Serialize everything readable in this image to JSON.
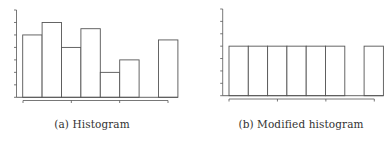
{
  "figure": {
    "captions": [
      {
        "label": "(a) Histogram"
      },
      {
        "label": "(b) Modified histogram"
      }
    ]
  },
  "chart_data": [
    {
      "type": "bar",
      "title": "(a) Histogram",
      "xlabel": "",
      "ylabel": "",
      "categories": [
        "1",
        "2",
        "3",
        "4",
        "5",
        "6",
        "7",
        "8"
      ],
      "values": [
        5,
        6,
        4,
        5.5,
        2,
        3,
        0,
        4.6
      ],
      "ylim": [
        0,
        7
      ],
      "y_ticks": 8,
      "x_ticks": 4,
      "grid": false,
      "legend": null,
      "bar_style": {
        "fill": "#ffffff",
        "stroke": "#555555"
      }
    },
    {
      "type": "bar",
      "title": "(b) Modified histogram",
      "xlabel": "",
      "ylabel": "",
      "categories": [
        "1",
        "2",
        "3",
        "4",
        "5",
        "6",
        "7",
        "8"
      ],
      "values": [
        4,
        4,
        4,
        4,
        4,
        4,
        0,
        4
      ],
      "ylim": [
        0,
        7
      ],
      "y_ticks": 8,
      "x_ticks": 4,
      "grid": false,
      "legend": null,
      "bar_style": {
        "fill": "#ffffff",
        "stroke": "#555555"
      }
    }
  ]
}
